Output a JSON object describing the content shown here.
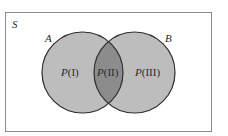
{
  "diagram": {
    "type": "venn",
    "universe": {
      "label": "S"
    },
    "sets": [
      {
        "id": "A",
        "label": "A"
      },
      {
        "id": "B",
        "label": "B"
      }
    ],
    "regions": [
      {
        "id": "I",
        "prob_symbol": "P",
        "roman": "(I)",
        "description": "A only"
      },
      {
        "id": "II",
        "prob_symbol": "P",
        "roman": "(II)",
        "description": "A and B"
      },
      {
        "id": "III",
        "prob_symbol": "P",
        "roman": "(III)",
        "description": "B only"
      }
    ],
    "colors": {
      "background": "#ffffff",
      "frame": "#8a8a8a",
      "circle_fill": "#bdbdbd",
      "intersection_fill": "#8c8c8c",
      "circle_stroke": "#2e2e2e",
      "text": "#2a2a2a"
    }
  }
}
